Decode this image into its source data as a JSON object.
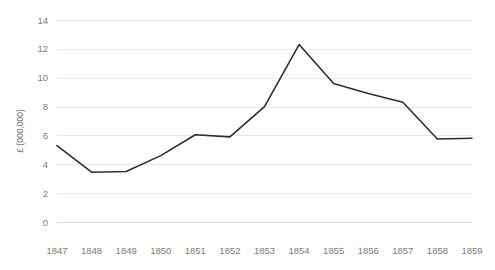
{
  "chart_data": {
    "type": "line",
    "title": "",
    "xlabel": "",
    "ylabel": "£ (000,000)",
    "categories": [
      "1847",
      "1848",
      "1849",
      "1850",
      "1851",
      "1852",
      "1853",
      "1854",
      "1855",
      "1856",
      "1857",
      "1858",
      "1859"
    ],
    "values": [
      5.3,
      3.45,
      3.5,
      4.6,
      6.05,
      5.9,
      8.0,
      12.3,
      9.6,
      8.9,
      8.3,
      5.75,
      5.8
    ],
    "series": [
      {
        "name": "£ (000,000)",
        "values": [
          5.3,
          3.45,
          3.5,
          4.6,
          6.05,
          5.9,
          8.0,
          12.3,
          9.6,
          8.9,
          8.3,
          5.75,
          5.8
        ]
      }
    ],
    "ylim": [
      0,
      14
    ],
    "yticks": [
      0,
      2,
      4,
      6,
      8,
      10,
      12,
      14
    ],
    "ytick_labels": [
      "0",
      "2",
      "4",
      "6",
      "8",
      "10",
      "12",
      "14"
    ],
    "grid": true,
    "grid_axis": "y",
    "legend": false,
    "legend_position": "none",
    "line_color": "#2e2e2e",
    "grid_color": "#e8e8e8",
    "tick_label_color": "#7a7a7a",
    "background_color": "#ffffff",
    "markers": false
  }
}
